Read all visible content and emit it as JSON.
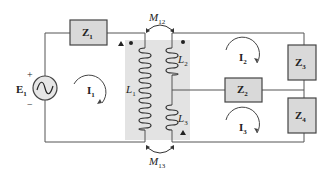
{
  "figure": {
    "colors": {
      "wire": "#555555",
      "box_fill": "#d9d9d9",
      "core_fill": "#e3e3e3",
      "coil": "#333333"
    },
    "source": {
      "name": "E",
      "sub": "1",
      "plus": "+",
      "minus": "−",
      "symbol": "∿"
    },
    "impedances": [
      {
        "name": "Z",
        "sub": "1"
      },
      {
        "name": "Z",
        "sub": "2"
      },
      {
        "name": "Z",
        "sub": "3"
      },
      {
        "name": "Z",
        "sub": "4"
      }
    ],
    "currents": [
      {
        "name": "I",
        "sub": "1"
      },
      {
        "name": "I",
        "sub": "2"
      },
      {
        "name": "I",
        "sub": "3"
      }
    ],
    "inductors": [
      {
        "name": "L",
        "sub": "1"
      },
      {
        "name": "L",
        "sub": "2"
      },
      {
        "name": "L",
        "sub": "3"
      }
    ],
    "mutuals": [
      {
        "name": "M",
        "sub": "12"
      },
      {
        "name": "M",
        "sub": "13"
      }
    ]
  }
}
